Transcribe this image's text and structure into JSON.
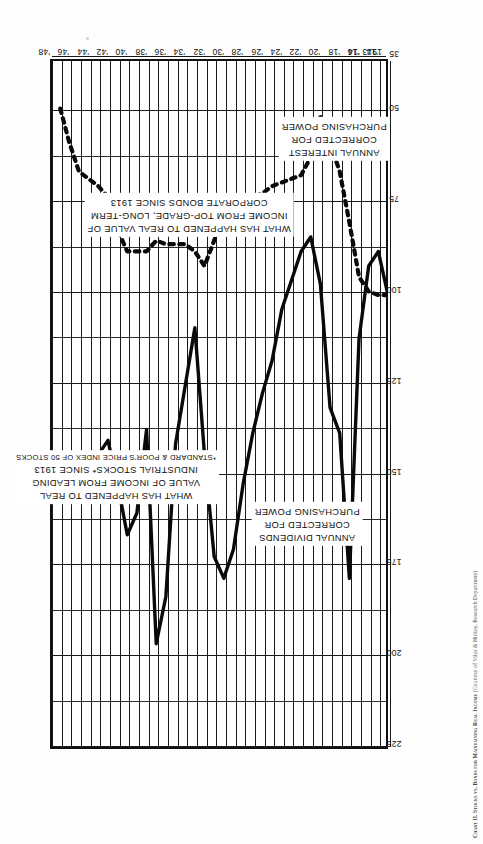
{
  "figure": {
    "caption_lead": "Chart II. Stocks vs. Bonds for Maintaining Real Income",
    "caption_credit": "(Courtesy of Vilas & Hickey, Research Department)"
  },
  "annotations": [
    {
      "name": "stocks-note",
      "lines": [
        "WHAT HAS HAPPENED TO REAL",
        "VALUE OF INCOME FROM LEADING",
        "INDUSTRIAL STOCKS* SINCE 1913"
      ],
      "footnote": "*STANDARD & POOR'S PRICE INDEX OF 50 STOCKS"
    },
    {
      "name": "bonds-note",
      "lines": [
        "WHAT HAS HAPPENED TO REAL VALUE OF",
        "INCOME FROM TOP-GRADE, LONG-TERM",
        "CORPORATE BONDS SINCE 1913"
      ],
      "footnote": ""
    },
    {
      "name": "dividends-note",
      "lines": [
        "ANNUAL DIVIDENDS",
        "CORRECTED FOR",
        "PURCHASING POWER"
      ],
      "footnote": ""
    },
    {
      "name": "interest-note",
      "lines": [
        "ANNUAL INTEREST",
        "CORRECTED FOR",
        "PURCHASING POWER"
      ],
      "footnote": ""
    }
  ],
  "chart_data": {
    "type": "line",
    "title": "Chart II. Stocks vs. Bonds for Maintaining Real Income",
    "xlabel": "",
    "ylabel": "",
    "grid": true,
    "legend": "inline-annotations",
    "xlim": [
      1913,
      1948
    ],
    "ylim": [
      35,
      225
    ],
    "yticks": [
      225,
      200,
      175,
      150,
      125,
      100,
      75,
      50,
      35
    ],
    "ytick_labels": [
      "225",
      "200",
      "175",
      "150",
      "125",
      "100",
      "75",
      "50",
      "35"
    ],
    "xticks": [
      1913,
      1914,
      1916,
      1918,
      1920,
      1922,
      1924,
      1926,
      1928,
      1930,
      1932,
      1934,
      1936,
      1938,
      1940,
      1942,
      1944,
      1946,
      1948
    ],
    "xtick_labels": [
      "1913",
      "'14",
      "'16",
      "'18",
      "'20",
      "'22",
      "'24",
      "'26",
      "'28",
      "'30",
      "'32",
      "'34",
      "'36",
      "'38",
      "'40",
      "'42",
      "'44",
      "'46",
      "'48"
    ],
    "series": [
      {
        "name": "Annual dividends corrected for purchasing power",
        "style": "solid",
        "x": [
          1913,
          1914,
          1915,
          1916,
          1917,
          1918,
          1919,
          1920,
          1921,
          1922,
          1923,
          1924,
          1925,
          1926,
          1927,
          1928,
          1929,
          1930,
          1931,
          1932,
          1933,
          1934,
          1935,
          1936,
          1937,
          1938,
          1939,
          1940,
          1941,
          1942,
          1943,
          1944,
          1945,
          1946,
          1947
        ],
        "y": [
          100,
          88,
          92,
          112,
          178,
          138,
          131,
          97,
          84,
          88,
          96,
          104,
          118,
          127,
          138,
          152,
          170,
          178,
          172,
          144,
          109,
          125,
          141,
          183,
          196,
          137,
          160,
          166,
          152,
          140,
          144,
          148,
          152,
          146,
          155
        ]
      },
      {
        "name": "Annual interest corrected for purchasing power",
        "style": "dotted",
        "x": [
          1913,
          1914,
          1915,
          1916,
          1917,
          1918,
          1919,
          1920,
          1921,
          1922,
          1923,
          1924,
          1925,
          1926,
          1927,
          1928,
          1929,
          1930,
          1931,
          1932,
          1933,
          1934,
          1935,
          1936,
          1937,
          1938,
          1939,
          1940,
          1941,
          1942,
          1943,
          1944,
          1945,
          1946,
          1947
        ],
        "y": [
          100,
          100,
          99,
          95,
          80,
          66,
          58,
          51,
          62,
          67,
          68,
          69,
          70,
          72,
          73,
          73,
          74,
          78,
          85,
          92,
          88,
          86,
          86,
          86,
          85,
          88,
          88,
          88,
          82,
          73,
          70,
          68,
          66,
          58,
          48
        ]
      }
    ]
  }
}
